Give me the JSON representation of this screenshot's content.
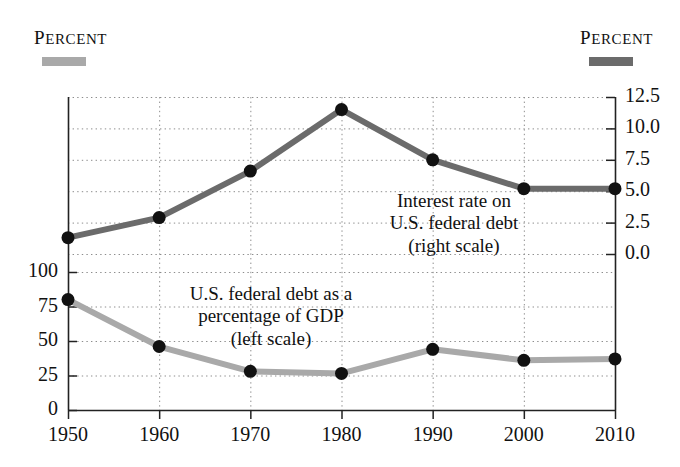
{
  "header": {
    "left_label": "Percent",
    "right_label": "Percent",
    "left_swatch_color": "#a9a9a9",
    "right_swatch_color": "#6b6b6b"
  },
  "annotations": {
    "right_series": {
      "line1": "Interest rate on",
      "line2": "U.S. federal debt",
      "line3": "(right scale)"
    },
    "left_series": {
      "line1": "U.S. federal debt as a",
      "line2": "percentage of GDP",
      "line3": "(left scale)"
    }
  },
  "chart_data": {
    "type": "line",
    "title": "",
    "xlabel": "",
    "grid": true,
    "legend_position": "top",
    "x": [
      1950,
      1960,
      1970,
      1980,
      1990,
      2000,
      2010
    ],
    "xtick_labels": [
      "1950",
      "1960",
      "1970",
      "1980",
      "1990",
      "2000",
      "2010"
    ],
    "axes": [
      {
        "id": "left",
        "ylabel": "Percent",
        "ylim": [
          0,
          100
        ],
        "ytick_values": [
          0,
          25,
          50,
          75,
          100
        ],
        "ytick_labels": [
          "0",
          "25",
          "50",
          "75",
          "100"
        ]
      },
      {
        "id": "right",
        "ylabel": "Percent",
        "ylim": [
          0.0,
          12.5
        ],
        "ytick_values": [
          0.0,
          2.5,
          5.0,
          7.5,
          10.0,
          12.5
        ],
        "ytick_labels": [
          "0.0",
          "2.5",
          "5.0",
          "7.5",
          "10.0",
          "12.5"
        ]
      }
    ],
    "series": [
      {
        "name": "U.S. federal debt as a percentage of GDP",
        "axis": "left",
        "color": "#a9a9a9",
        "marker_color": "#111111",
        "values": [
          80,
          46,
          28,
          26.5,
          44,
          36,
          37
        ]
      },
      {
        "name": "Interest rate on U.S. federal debt",
        "axis": "right",
        "color": "#6b6b6b",
        "marker_color": "#111111",
        "values": [
          1.3,
          2.9,
          6.6,
          11.5,
          7.5,
          5.2,
          5.2
        ]
      }
    ]
  }
}
